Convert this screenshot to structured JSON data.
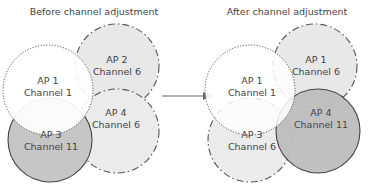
{
  "diagram": {
    "before": {
      "title": "Before channel adjustment",
      "aps": [
        {
          "name": "AP 1",
          "channel": "Channel 1",
          "style": "dotted",
          "fill": "#ffffff"
        },
        {
          "name": "AP 2",
          "channel": "Channel 6",
          "style": "dashdot",
          "fill": "#e6e6e6"
        },
        {
          "name": "AP 3",
          "channel": "Channel 11",
          "style": "solid",
          "fill": "#c4c4c4"
        },
        {
          "name": "AP 4",
          "channel": "Channel 6",
          "style": "dashdot",
          "fill": "#e6e6e6"
        }
      ]
    },
    "after": {
      "title": "After channel adjustment",
      "aps": [
        {
          "name": "AP 1",
          "channel": "Channel 1",
          "style": "dotted",
          "fill": "#ffffff"
        },
        {
          "name": "AP 1",
          "channel": "Channel 6",
          "style": "dashdot",
          "fill": "#e6e6e6"
        },
        {
          "name": "AP 3",
          "channel": "Channel 6",
          "style": "dashdot",
          "fill": "#e6e6e6"
        },
        {
          "name": "AP 4",
          "channel": "Channel 11",
          "style": "solid",
          "fill": "#bdbdbd"
        }
      ]
    },
    "arrow": "right-arrow"
  }
}
